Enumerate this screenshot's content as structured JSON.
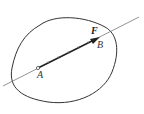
{
  "diagram": {
    "type": "force-vector-on-rigid-body",
    "labels": {
      "force": "F",
      "point_a": "A",
      "point_b": "B"
    },
    "colors": {
      "outline": "#333333",
      "line": "#555555",
      "vector": "#222222"
    }
  }
}
